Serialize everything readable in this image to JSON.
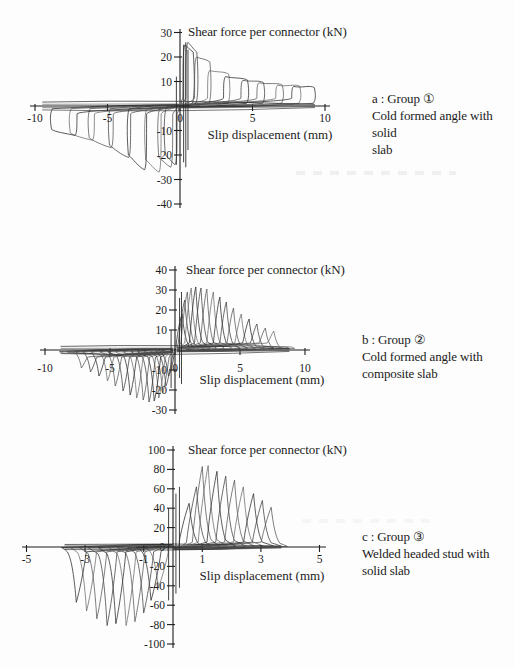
{
  "page": {
    "background": "#fdfdfd",
    "ink": "#1c1c1c"
  },
  "captions": [
    {
      "line1": "a : Group ①",
      "line2": "Cold formed angle with solid",
      "line3": "slab"
    },
    {
      "line1": "b : Group ②",
      "line2": "Cold formed angle with",
      "line3": "composite slab"
    },
    {
      "line1": "c : Group ③",
      "line2": "Welded headed stud with",
      "line3": "solid slab"
    }
  ],
  "chart_data": [
    {
      "type": "line",
      "loop_style": "flag",
      "title": "Shear force per connector  (kN)",
      "xlabel": "Slip displacement (mm)",
      "xlim": [
        -10,
        10
      ],
      "ylim": [
        -40,
        30
      ],
      "xticks": [
        -10,
        -5,
        0,
        5,
        10
      ],
      "yticks": [
        30,
        20,
        10,
        -10,
        -20,
        -30,
        -40
      ],
      "units": {
        "x": "mm",
        "y": "kN"
      },
      "cycles_pos": [
        {
          "inner": 0.2,
          "outer": 0.95,
          "peak": 25,
          "end": 22
        },
        {
          "inner": 0.4,
          "outer": 1.2,
          "peak": 26,
          "end": 22
        },
        {
          "inner": 1.0,
          "outer": 2.1,
          "peak": 20,
          "end": 18
        },
        {
          "inner": 1.9,
          "outer": 3.4,
          "peak": 14.5,
          "end": 13
        },
        {
          "inner": 3.0,
          "outer": 4.7,
          "peak": 12,
          "end": 10.5
        },
        {
          "inner": 4.2,
          "outer": 5.8,
          "peak": 10.5,
          "end": 9.5
        },
        {
          "inner": 5.3,
          "outer": 7.1,
          "peak": 9.5,
          "end": 8.5
        },
        {
          "inner": 6.6,
          "outer": 8.3,
          "peak": 8.5,
          "end": 8
        },
        {
          "inner": 7.7,
          "outer": 9.3,
          "peak": 8,
          "end": 7.5
        }
      ],
      "cycles_neg": [
        {
          "inner": -0.2,
          "outer": -1.05,
          "peak": -24,
          "end": -20
        },
        {
          "inner": -0.5,
          "outer": -1.5,
          "peak": -25,
          "end": -21
        },
        {
          "inner": -1.3,
          "outer": -2.4,
          "peak": -27,
          "end": -22
        },
        {
          "inner": -2.3,
          "outer": -3.6,
          "peak": -26,
          "end": -20
        },
        {
          "inner": -3.4,
          "outer": -4.9,
          "peak": -21,
          "end": -16
        },
        {
          "inner": -4.6,
          "outer": -6.3,
          "peak": -17,
          "end": -13
        },
        {
          "inner": -5.9,
          "outer": -7.6,
          "peak": -14,
          "end": -11
        },
        {
          "inner": -7.1,
          "outer": -8.9,
          "peak": -12,
          "end": -9.5
        }
      ],
      "pinch_spikes": [
        {
          "x": 0.25,
          "y1": -23,
          "y2": 25
        },
        {
          "x": 0.4,
          "y1": -25,
          "y2": 26
        },
        {
          "x": 0.55,
          "y1": -18,
          "y2": 23
        },
        {
          "x": -0.25,
          "y1": -24,
          "y2": 12
        }
      ],
      "band": {
        "x1": -9.5,
        "x2": 9.3,
        "offsets": [
          -1.6,
          -0.7,
          0.7,
          1.6
        ]
      }
    },
    {
      "type": "line",
      "loop_style": "petal",
      "title": "Shear force per connector  (kN)",
      "xlabel": "Slip displacement (mm)",
      "xlim": [
        -10,
        10
      ],
      "ylim": [
        -30,
        40
      ],
      "xticks": [
        -10,
        -5,
        0,
        5,
        10
      ],
      "yticks": [
        40,
        30,
        20,
        10,
        -10,
        -20,
        -30
      ],
      "units": {
        "x": "mm",
        "y": "kN"
      },
      "cycles_pos": [
        {
          "p": 0.55,
          "peak": 18,
          "tail": 1.2
        },
        {
          "p": 0.75,
          "peak": 25,
          "tail": 1.5
        },
        {
          "p": 0.95,
          "peak": 29,
          "tail": 1.8
        },
        {
          "p": 1.25,
          "peak": 31,
          "tail": 2.2
        },
        {
          "p": 1.6,
          "peak": 31.5,
          "tail": 2.7
        },
        {
          "p": 2.0,
          "peak": 31,
          "tail": 3.2
        },
        {
          "p": 2.45,
          "peak": 30.5,
          "tail": 3.8
        },
        {
          "p": 2.95,
          "peak": 29,
          "tail": 4.4
        },
        {
          "p": 3.45,
          "peak": 26.5,
          "tail": 5.0
        },
        {
          "p": 3.95,
          "peak": 24,
          "tail": 5.6
        },
        {
          "p": 4.5,
          "peak": 21,
          "tail": 6.2
        },
        {
          "p": 5.1,
          "peak": 18,
          "tail": 6.9
        },
        {
          "p": 5.7,
          "peak": 15.5,
          "tail": 7.6
        },
        {
          "p": 6.3,
          "peak": 13,
          "tail": 8.2
        },
        {
          "p": 6.95,
          "peak": 11,
          "tail": 8.8
        },
        {
          "p": 7.6,
          "peak": 9.5,
          "tail": 9.2
        }
      ],
      "cycles_neg": [
        {
          "p": -0.5,
          "peak": -13,
          "tail": -1.1
        },
        {
          "p": -0.7,
          "peak": -18,
          "tail": -1.5
        },
        {
          "p": -0.95,
          "peak": -21.5,
          "tail": -1.9
        },
        {
          "p": -1.25,
          "peak": -24,
          "tail": -2.4
        },
        {
          "p": -1.6,
          "peak": -25.5,
          "tail": -2.9
        },
        {
          "p": -2.0,
          "peak": -26,
          "tail": -3.4
        },
        {
          "p": -2.45,
          "peak": -25,
          "tail": -4.0
        },
        {
          "p": -2.95,
          "peak": -24,
          "tail": -4.6
        },
        {
          "p": -3.45,
          "peak": -22.5,
          "tail": -5.2
        },
        {
          "p": -4.0,
          "peak": -20.5,
          "tail": -5.8
        },
        {
          "p": -4.6,
          "peak": -18,
          "tail": -6.5
        },
        {
          "p": -5.2,
          "peak": -15.5,
          "tail": -7.1
        },
        {
          "p": -5.85,
          "peak": -13,
          "tail": -7.7
        },
        {
          "p": -6.5,
          "peak": -11,
          "tail": -8.3
        },
        {
          "p": -7.2,
          "peak": -9,
          "tail": -8.9
        }
      ],
      "pinch_spikes": [
        {
          "x": 0.35,
          "y1": -14,
          "y2": 26
        },
        {
          "x": 0.5,
          "y1": -17,
          "y2": 29
        },
        {
          "x": -0.3,
          "y1": -19,
          "y2": 10
        }
      ],
      "band": {
        "x1": -8.8,
        "x2": 8.8,
        "offsets": [
          -1.8,
          -0.8,
          0.8,
          1.8
        ]
      }
    },
    {
      "type": "line",
      "loop_style": "petal-lean",
      "title": "Shear force per connector  (kN)",
      "xlabel": "Slip displacement (mm)",
      "xlim": [
        -5,
        5
      ],
      "ylim": [
        -100,
        100
      ],
      "xticks": [
        -5,
        -3,
        -1,
        1,
        3,
        5
      ],
      "yticks": [
        100,
        80,
        60,
        40,
        20,
        0,
        -20,
        -40,
        -60,
        -80,
        -100
      ],
      "units": {
        "x": "mm",
        "y": "kN"
      },
      "cycles_pos": [
        {
          "p": 0.55,
          "peak": 45,
          "tail": 1.0
        },
        {
          "p": 0.8,
          "peak": 62,
          "tail": 1.3
        },
        {
          "p": 1.0,
          "peak": 83,
          "tail": 1.6
        },
        {
          "p": 1.2,
          "peak": 84,
          "tail": 1.85
        },
        {
          "p": 1.5,
          "peak": 78,
          "tail": 2.15
        },
        {
          "p": 1.8,
          "peak": 73,
          "tail": 2.5
        },
        {
          "p": 2.1,
          "peak": 69,
          "tail": 2.8
        },
        {
          "p": 2.4,
          "peak": 62,
          "tail": 3.1
        },
        {
          "p": 2.75,
          "peak": 55,
          "tail": 3.45
        },
        {
          "p": 3.05,
          "peak": 48,
          "tail": 3.7
        },
        {
          "p": 3.35,
          "peak": 41,
          "tail": 3.9
        }
      ],
      "cycles_neg": [
        {
          "p": -0.5,
          "peak": -42,
          "tail": -0.95
        },
        {
          "p": -0.75,
          "peak": -55,
          "tail": -1.25
        },
        {
          "p": -1.0,
          "peak": -68,
          "tail": -1.55
        },
        {
          "p": -1.3,
          "peak": -77,
          "tail": -1.9
        },
        {
          "p": -1.6,
          "peak": -81,
          "tail": -2.2
        },
        {
          "p": -1.95,
          "peak": -79,
          "tail": -2.55
        },
        {
          "p": -2.25,
          "peak": -81,
          "tail": -2.9
        },
        {
          "p": -2.6,
          "peak": -74,
          "tail": -3.2
        },
        {
          "p": -2.95,
          "peak": -66,
          "tail": -3.5
        },
        {
          "p": -3.3,
          "peak": -57,
          "tail": -3.8
        }
      ],
      "pinch_spikes": [
        {
          "x": 0.1,
          "y1": -48,
          "y2": 55
        },
        {
          "x": 0.22,
          "y1": -42,
          "y2": 62
        },
        {
          "x": -0.15,
          "y1": -55,
          "y2": 40
        }
      ],
      "band": {
        "x1": -3.7,
        "x2": 3.7,
        "offsets": [
          -2.6,
          -1.2,
          1.2,
          2.6
        ]
      }
    }
  ]
}
